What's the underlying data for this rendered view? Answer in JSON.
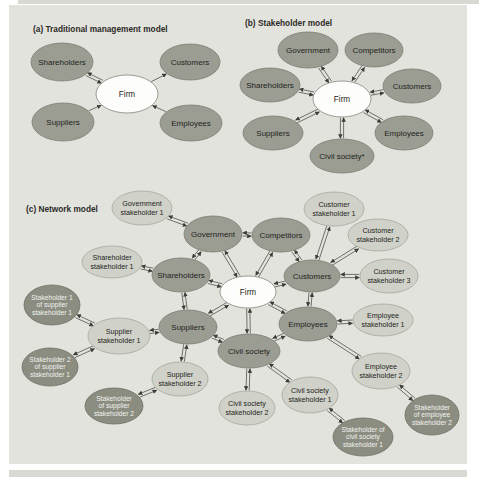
{
  "colors": {
    "page_bg": "#ffffff",
    "panel_bg": "#e3e3de",
    "strip_bg": "#d9d9d4",
    "title": "#2b2b27",
    "arrow": "#3c3e38",
    "tier1_fill": "#9b9d93",
    "tier1_stroke": "#7c7e74",
    "tier2_fill": "#d0d1c8",
    "tier2_stroke": "#a6a79d",
    "tier3_fill": "#8b8d81",
    "tier3_stroke": "#6e7066",
    "firm_fill": "#fdfdfb",
    "firm_stroke": "#85877d",
    "text_dark": "#1f1f1c",
    "text_light": "#f2f2ee"
  },
  "figure": {
    "panels": [
      {
        "label": "a",
        "title": "(a) Traditional management model",
        "nodes": [
          {
            "id": "shareholders",
            "label": "Shareholders",
            "x": 62,
            "y": 62,
            "rx": 31,
            "ry": 19,
            "tier": "t1"
          },
          {
            "id": "customers",
            "label": "Customers",
            "x": 190,
            "y": 62,
            "rx": 30,
            "ry": 18,
            "tier": "t1"
          },
          {
            "id": "firm",
            "label": "Firm",
            "x": 127,
            "y": 94,
            "rx": 31,
            "ry": 19,
            "tier": "firm"
          },
          {
            "id": "suppliers",
            "label": "Suppliers",
            "x": 63,
            "y": 122,
            "rx": 31,
            "ry": 19,
            "tier": "t1"
          },
          {
            "id": "employees",
            "label": "Employees",
            "x": 191,
            "y": 123,
            "rx": 31,
            "ry": 18,
            "tier": "t1"
          }
        ],
        "edges": [
          {
            "a": "shareholders",
            "b": "firm",
            "type": "double"
          },
          {
            "a": "firm",
            "b": "customers",
            "type": "single"
          },
          {
            "a": "suppliers",
            "b": "firm",
            "type": "single"
          },
          {
            "a": "employees",
            "b": "firm",
            "type": "single"
          }
        ]
      },
      {
        "label": "b",
        "title": "(b) Stakeholder model",
        "nodes": [
          {
            "id": "government",
            "label": "Government",
            "x": 308,
            "y": 50,
            "rx": 30,
            "ry": 18,
            "tier": "t1"
          },
          {
            "id": "competitors",
            "label": "Competitors",
            "x": 374,
            "y": 50,
            "rx": 29,
            "ry": 17,
            "tier": "t1"
          },
          {
            "id": "shareholders",
            "label": "Shareholders",
            "x": 270,
            "y": 85,
            "rx": 30,
            "ry": 17,
            "tier": "t1"
          },
          {
            "id": "customers",
            "label": "Customers",
            "x": 412,
            "y": 86,
            "rx": 29,
            "ry": 17,
            "tier": "t1"
          },
          {
            "id": "firm",
            "label": "Firm",
            "x": 342,
            "y": 99,
            "rx": 29,
            "ry": 18,
            "tier": "firm"
          },
          {
            "id": "suppliers",
            "label": "Suppliers",
            "x": 273,
            "y": 133,
            "rx": 30,
            "ry": 17,
            "tier": "t1"
          },
          {
            "id": "employees",
            "label": "Employees",
            "x": 404,
            "y": 133,
            "rx": 29,
            "ry": 17,
            "tier": "t1"
          },
          {
            "id": "civil_society",
            "label": "Civil society*",
            "x": 342,
            "y": 156,
            "rx": 32,
            "ry": 17,
            "tier": "t1"
          }
        ],
        "edges": [
          {
            "a": "firm",
            "b": "government",
            "type": "double"
          },
          {
            "a": "firm",
            "b": "competitors",
            "type": "double"
          },
          {
            "a": "firm",
            "b": "shareholders",
            "type": "double"
          },
          {
            "a": "firm",
            "b": "customers",
            "type": "double"
          },
          {
            "a": "firm",
            "b": "suppliers",
            "type": "double"
          },
          {
            "a": "firm",
            "b": "employees",
            "type": "double"
          },
          {
            "a": "firm",
            "b": "civil_society",
            "type": "double"
          }
        ]
      },
      {
        "label": "c",
        "title": "(c) Network model",
        "nodes": [
          {
            "id": "government_st1",
            "label": "Government\nstakeholder 1",
            "x": 142,
            "y": 208,
            "rx": 30,
            "ry": 17,
            "tier": "t2"
          },
          {
            "id": "customer_st1",
            "label": "Customer\nstakeholder 1",
            "x": 334,
            "y": 209,
            "rx": 30,
            "ry": 17,
            "tier": "t2"
          },
          {
            "id": "government",
            "label": "Government",
            "x": 213,
            "y": 234,
            "rx": 29,
            "ry": 18,
            "tier": "t1"
          },
          {
            "id": "competitors",
            "label": "Competitors",
            "x": 281,
            "y": 235,
            "rx": 29,
            "ry": 17,
            "tier": "t1"
          },
          {
            "id": "customer_st2",
            "label": "Customer\nstakeholder 2",
            "x": 378,
            "y": 235,
            "rx": 30,
            "ry": 16,
            "tier": "t2"
          },
          {
            "id": "shareholder_st1",
            "label": "Shareholder\nstakeholder 1",
            "x": 112,
            "y": 262,
            "rx": 30,
            "ry": 16,
            "tier": "t2"
          },
          {
            "id": "shareholders",
            "label": "Shareholders",
            "x": 181,
            "y": 275,
            "rx": 29,
            "ry": 17,
            "tier": "t1"
          },
          {
            "id": "customers",
            "label": "Customers",
            "x": 312,
            "y": 276,
            "rx": 28,
            "ry": 16,
            "tier": "t1"
          },
          {
            "id": "customer_st3",
            "label": "Customer\nstakeholder 3",
            "x": 389,
            "y": 276,
            "rx": 29,
            "ry": 17,
            "tier": "t2"
          },
          {
            "id": "firm",
            "label": "Firm",
            "x": 248,
            "y": 292,
            "rx": 28,
            "ry": 16,
            "tier": "firm"
          },
          {
            "id": "s1s1",
            "label": "Stakeholder 1\nof supplier\nstakeholder 1",
            "x": 52,
            "y": 305,
            "rx": 28,
            "ry": 20,
            "tier": "t3"
          },
          {
            "id": "employee_st1",
            "label": "Employee\nstakeholder 1",
            "x": 383,
            "y": 320,
            "rx": 30,
            "ry": 16,
            "tier": "t2"
          },
          {
            "id": "employees",
            "label": "Employees",
            "x": 308,
            "y": 324,
            "rx": 29,
            "ry": 17,
            "tier": "t1"
          },
          {
            "id": "suppliers",
            "label": "Suppliers",
            "x": 188,
            "y": 327,
            "rx": 29,
            "ry": 17,
            "tier": "t1"
          },
          {
            "id": "supplier_st1",
            "label": "Supplier\nstakeholder 1",
            "x": 119,
            "y": 336,
            "rx": 31,
            "ry": 18,
            "tier": "t2"
          },
          {
            "id": "civil_society",
            "label": "Civil society",
            "x": 249,
            "y": 351,
            "rx": 31,
            "ry": 17,
            "tier": "t1"
          },
          {
            "id": "s2s1",
            "label": "Stakeholder 2\nof supplier\nstakeholder 1",
            "x": 50,
            "y": 367,
            "rx": 28,
            "ry": 19,
            "tier": "t3"
          },
          {
            "id": "employee_st2",
            "label": "Employee\nstakeholder 2",
            "x": 381,
            "y": 371,
            "rx": 29,
            "ry": 18,
            "tier": "t2"
          },
          {
            "id": "supplier_st2",
            "label": "Supplier\nstakeholder 2",
            "x": 180,
            "y": 379,
            "rx": 28,
            "ry": 17,
            "tier": "t2"
          },
          {
            "id": "cs_st1",
            "label": "Civil society\nstakeholder 1",
            "x": 310,
            "y": 395,
            "rx": 28,
            "ry": 18,
            "tier": "t2"
          },
          {
            "id": "ss2",
            "label": "Stakeholder\nof supplier\nstakeholder 2",
            "x": 114,
            "y": 406,
            "rx": 29,
            "ry": 18,
            "tier": "t3"
          },
          {
            "id": "cs_st2",
            "label": "Civil society\nstakeholder 2",
            "x": 247,
            "y": 408,
            "rx": 28,
            "ry": 17,
            "tier": "t2"
          },
          {
            "id": "ses2",
            "label": "Stakeholder\nof employee\nstakeholder 2",
            "x": 432,
            "y": 415,
            "rx": 27,
            "ry": 20,
            "tier": "t3"
          },
          {
            "id": "scs1",
            "label": "Stakeholder of\ncivil society\nstakeholder 1",
            "x": 363,
            "y": 437,
            "rx": 30,
            "ry": 19,
            "tier": "t3"
          }
        ],
        "edges": [
          {
            "a": "firm",
            "b": "government",
            "type": "double"
          },
          {
            "a": "firm",
            "b": "competitors",
            "type": "double"
          },
          {
            "a": "firm",
            "b": "shareholders",
            "type": "double"
          },
          {
            "a": "firm",
            "b": "customers",
            "type": "double"
          },
          {
            "a": "firm",
            "b": "suppliers",
            "type": "double"
          },
          {
            "a": "firm",
            "b": "employees",
            "type": "double"
          },
          {
            "a": "firm",
            "b": "civil_society",
            "type": "double"
          },
          {
            "a": "government",
            "b": "competitors",
            "type": "double"
          },
          {
            "a": "shareholders",
            "b": "government",
            "type": "double"
          },
          {
            "a": "competitors",
            "b": "customers",
            "type": "double"
          },
          {
            "a": "shareholders",
            "b": "suppliers",
            "type": "double"
          },
          {
            "a": "customers",
            "b": "employees",
            "type": "double"
          },
          {
            "a": "suppliers",
            "b": "civil_society",
            "type": "double"
          },
          {
            "a": "employees",
            "b": "civil_society",
            "type": "double"
          },
          {
            "a": "government_st1",
            "b": "government",
            "type": "double"
          },
          {
            "a": "shareholder_st1",
            "b": "shareholders",
            "type": "double"
          },
          {
            "a": "customer_st1",
            "b": "customers",
            "type": "double"
          },
          {
            "a": "customer_st2",
            "b": "customers",
            "type": "double"
          },
          {
            "a": "customer_st3",
            "b": "customers",
            "type": "double"
          },
          {
            "a": "employee_st1",
            "b": "employees",
            "type": "double"
          },
          {
            "a": "employee_st2",
            "b": "employees",
            "type": "double"
          },
          {
            "a": "supplier_st1",
            "b": "suppliers",
            "type": "double"
          },
          {
            "a": "supplier_st2",
            "b": "suppliers",
            "type": "double"
          },
          {
            "a": "cs_st1",
            "b": "civil_society",
            "type": "double"
          },
          {
            "a": "cs_st2",
            "b": "civil_society",
            "type": "double"
          },
          {
            "a": "s1s1",
            "b": "supplier_st1",
            "type": "double"
          },
          {
            "a": "s2s1",
            "b": "supplier_st1",
            "type": "double"
          },
          {
            "a": "ss2",
            "b": "supplier_st2",
            "type": "double"
          },
          {
            "a": "scs1",
            "b": "cs_st1",
            "type": "double"
          },
          {
            "a": "ses2",
            "b": "employee_st2",
            "type": "double"
          }
        ]
      }
    ]
  }
}
